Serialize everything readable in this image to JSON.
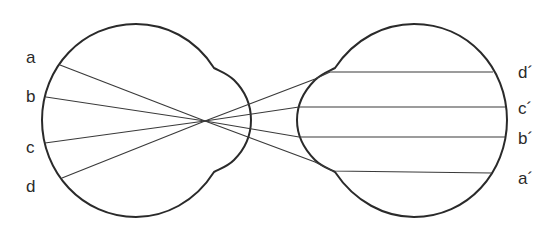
{
  "diagram": {
    "left_eye": {
      "labels": [
        {
          "id": "a",
          "text": "a"
        },
        {
          "id": "b",
          "text": "b"
        },
        {
          "id": "c",
          "text": "c"
        },
        {
          "id": "d",
          "text": "d"
        }
      ]
    },
    "right_eye": {
      "labels": [
        {
          "id": "d_prime",
          "text": "d´"
        },
        {
          "id": "c_prime",
          "text": "c´"
        },
        {
          "id": "b_prime",
          "text": "b´"
        },
        {
          "id": "a_prime",
          "text": "a´"
        }
      ]
    },
    "colors": {
      "stroke": "#2a2a2a",
      "background": "#ffffff"
    }
  }
}
